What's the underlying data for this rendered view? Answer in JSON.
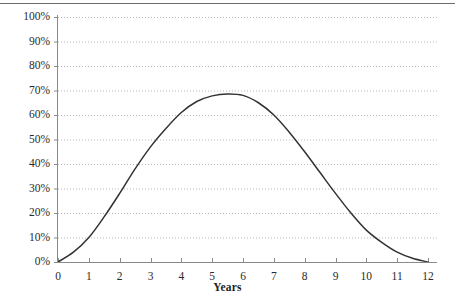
{
  "chart_data": {
    "type": "line",
    "title": "",
    "subtitle": "",
    "xlabel": "Years",
    "ylabel": "",
    "xlim": [
      0,
      12
    ],
    "ylim": [
      0,
      100
    ],
    "grid": true,
    "legend": false,
    "x_tick_labels": [
      "0",
      "1",
      "2",
      "3",
      "4",
      "5",
      "6",
      "7",
      "8",
      "9",
      "10",
      "11",
      "12"
    ],
    "y_tick_labels": [
      "0%",
      "10%",
      "20%",
      "30%",
      "40%",
      "50%",
      "60%",
      "70%",
      "80%",
      "90%",
      "100%"
    ],
    "y_tick_values": [
      0,
      10,
      20,
      30,
      40,
      50,
      60,
      70,
      80,
      90,
      100
    ],
    "x_tick_values": [
      0,
      1,
      2,
      3,
      4,
      5,
      6,
      7,
      8,
      9,
      10,
      11,
      12
    ],
    "series": [
      {
        "name": "",
        "x": [
          0,
          0.5,
          1,
          1.5,
          2,
          2.5,
          3,
          3.5,
          4,
          4.5,
          5,
          5.5,
          6,
          6.5,
          7,
          7.5,
          8,
          8.5,
          9,
          9.5,
          10,
          10.5,
          11,
          11.5,
          12
        ],
        "values": [
          0,
          4,
          10,
          18.5,
          28,
          38,
          47,
          54.5,
          61,
          65.5,
          67.8,
          68.6,
          68,
          65,
          60,
          53,
          45,
          36.5,
          28,
          20,
          13,
          8,
          4,
          1.5,
          0
        ],
        "color": "#333333",
        "line_width": 1.5
      }
    ],
    "colors": {
      "curve": "#333333",
      "gridline": "#b9b9b9",
      "axis": "#8a8a8a",
      "tick_text": "#2b2b2b",
      "border": "#6b6b6b",
      "background": "#ffffff"
    }
  }
}
